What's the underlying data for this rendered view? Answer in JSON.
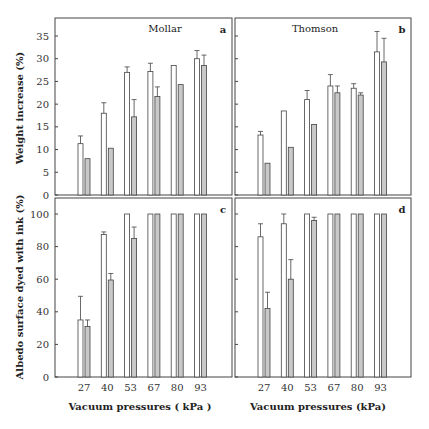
{
  "chart_data": [
    {
      "type": "bar",
      "panel": "a",
      "title": "Mollar",
      "categories": [
        "27",
        "40",
        "53",
        "67",
        "80",
        "93"
      ],
      "ylabel": "Weight increase (%)",
      "xlabel": "",
      "ylim": [
        0,
        38
      ],
      "yticks": [
        0,
        5,
        10,
        15,
        20,
        25,
        30,
        35
      ],
      "series": [
        {
          "name": "white",
          "values": [
            11.3,
            18,
            27,
            27.2,
            28.5,
            30
          ],
          "errors": [
            1.7,
            2.3,
            1.2,
            1.8,
            0,
            1.8
          ]
        },
        {
          "name": "gray",
          "values": [
            8,
            10.3,
            17.2,
            21.7,
            24.3,
            28.5
          ],
          "errors": [
            0,
            0,
            3.8,
            2.1,
            0,
            2.3
          ]
        }
      ]
    },
    {
      "type": "bar",
      "panel": "b",
      "title": "Thomson",
      "categories": [
        "27",
        "40",
        "53",
        "67",
        "80",
        "93"
      ],
      "ylabel": "",
      "xlabel": "",
      "ylim": [
        0,
        38
      ],
      "yticks": [
        0,
        5,
        10,
        15,
        20,
        25,
        30,
        35
      ],
      "series": [
        {
          "name": "white",
          "values": [
            13.2,
            18.5,
            21,
            24,
            23.5,
            31.5
          ],
          "errors": [
            0.8,
            0,
            2,
            2.5,
            1,
            4.5
          ]
        },
        {
          "name": "gray",
          "values": [
            7,
            10.5,
            15.5,
            22.5,
            22,
            29.3
          ],
          "errors": [
            0,
            0,
            0,
            1.5,
            0.5,
            5.2
          ]
        }
      ]
    },
    {
      "type": "bar",
      "panel": "c",
      "title": "",
      "categories": [
        "27",
        "40",
        "53",
        "67",
        "80",
        "93"
      ],
      "ylabel": "Albedo surface dyed with ink (%)",
      "xlabel": "Vacuum pressures ( kPa )",
      "ylim": [
        0,
        105
      ],
      "yticks": [
        0,
        20,
        40,
        60,
        80,
        100
      ],
      "series": [
        {
          "name": "white",
          "values": [
            35,
            87.5,
            100,
            100,
            100,
            100
          ],
          "errors": [
            14.5,
            1.5,
            0,
            0,
            0,
            0
          ]
        },
        {
          "name": "gray",
          "values": [
            31,
            59.5,
            85,
            100,
            100,
            100
          ],
          "errors": [
            4,
            4,
            7,
            0,
            0,
            0
          ]
        }
      ]
    },
    {
      "type": "bar",
      "panel": "d",
      "title": "",
      "categories": [
        "27",
        "40",
        "53",
        "67",
        "80",
        "93"
      ],
      "ylabel": "",
      "xlabel": "Vacuum pressures (kPa)",
      "ylim": [
        0,
        105
      ],
      "yticks": [
        0,
        20,
        40,
        60,
        80,
        100
      ],
      "series": [
        {
          "name": "white",
          "values": [
            86,
            94,
            100,
            100,
            100,
            100
          ],
          "errors": [
            8,
            6,
            0,
            0,
            0,
            0
          ]
        },
        {
          "name": "gray",
          "values": [
            42,
            60,
            96,
            100,
            100,
            100
          ],
          "errors": [
            10,
            12,
            2,
            0,
            0,
            0
          ]
        }
      ]
    }
  ],
  "labels": {
    "top_ylabel": "Weight increase (%)",
    "bottom_ylabel": "Albedo surface dyed with ink (%)",
    "left_xlabel": "Vacuum pressures ( kPa )",
    "right_xlabel": "Vacuum pressures (kPa)",
    "panel_a_title": "Mollar",
    "panel_b_title": "Thomson",
    "letter_a": "a",
    "letter_b": "b",
    "letter_c": "c",
    "letter_d": "d"
  },
  "colors": {
    "white_bar": "#ffffff",
    "gray_bar": "#c8c8c8",
    "stroke": "#444444"
  }
}
